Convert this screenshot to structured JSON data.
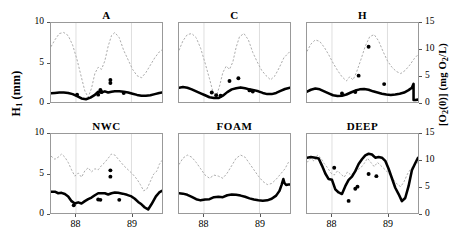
{
  "figure": {
    "y_axis_left": {
      "label": "H",
      "sub": "1",
      "units": "(mm)"
    },
    "y_axis_right": {
      "label_pre": "[O",
      "sub1": "2",
      "label_mid": "(0)] (mg O",
      "sub2": "2",
      "label_post": "/L)"
    }
  },
  "chart_data": {
    "type": "line",
    "title": "",
    "xlabel": "",
    "ylabel": "H1 (mm)",
    "y2label": "[O2(0)] (mg O2/L)",
    "xlim": [
      87.55,
      89.55
    ],
    "ylim": [
      0,
      10
    ],
    "y2lim": [
      0,
      15
    ],
    "xticks": [
      88,
      89
    ],
    "xtick_labels": [
      "88",
      "89"
    ],
    "yticks": [
      0,
      5,
      10
    ],
    "ytick_labels": [
      "0",
      "5",
      "10"
    ],
    "y2ticks": [
      0,
      5,
      10,
      15
    ],
    "y2tick_labels": [
      "0",
      "5",
      "10",
      "15"
    ],
    "grid": false,
    "legend": "none",
    "series_styles": {
      "h1_line": {
        "name": "H1",
        "style": "solid",
        "color": "#000000",
        "width": 2.6,
        "axis": "left"
      },
      "o2_line": {
        "name": "[O2(0)]",
        "style": "dashed",
        "color": "#aaaaaa",
        "width": 1.0,
        "axis": "right"
      },
      "o2_points": {
        "name": "[O2(0)] measured",
        "marker": "filled-circle",
        "color": "#000000",
        "size": 4.0,
        "axis": "right"
      }
    },
    "panels": [
      {
        "id": "A",
        "title": "A",
        "row": 0,
        "col": 0,
        "h1_line": {
          "x": [
            87.55,
            87.62,
            87.7,
            87.78,
            87.86,
            87.94,
            88.02,
            88.1,
            88.18,
            88.26,
            88.34,
            88.4,
            88.46,
            88.52,
            88.58,
            88.64,
            88.7,
            88.78,
            88.86,
            88.94,
            89.02,
            89.1,
            89.18,
            89.26,
            89.34,
            89.42,
            89.5,
            89.55
          ],
          "y": [
            1.1,
            1.15,
            1.2,
            1.2,
            1.15,
            1.0,
            0.75,
            0.45,
            0.35,
            0.55,
            0.9,
            1.3,
            1.2,
            1.35,
            1.2,
            1.3,
            1.35,
            1.35,
            1.3,
            1.2,
            1.05,
            0.9,
            0.8,
            0.8,
            0.85,
            1.0,
            1.15,
            1.2
          ]
        },
        "o2_line": {
          "x": [
            87.55,
            87.62,
            87.7,
            87.78,
            87.86,
            87.94,
            88.02,
            88.1,
            88.16,
            88.22,
            88.28,
            88.34,
            88.4,
            88.46,
            88.52,
            88.58,
            88.64,
            88.7,
            88.78,
            88.86,
            88.94,
            89.02,
            89.1,
            89.18,
            89.26,
            89.34,
            89.42,
            89.5,
            89.55
          ],
          "y": [
            10.5,
            11.8,
            13.0,
            13.2,
            12.6,
            10.8,
            8.0,
            4.6,
            2.1,
            0.9,
            2.6,
            5.4,
            6.6,
            6.2,
            7.8,
            10.6,
            12.6,
            13.2,
            12.2,
            9.8,
            8.0,
            6.2,
            5.0,
            4.6,
            5.6,
            7.0,
            8.4,
            9.5,
            9.9
          ]
        },
        "o2_points": [
          {
            "x": 88.02,
            "y": 1.4
          },
          {
            "x": 88.4,
            "y": 1.4
          },
          {
            "x": 88.44,
            "y": 2.3
          },
          {
            "x": 88.46,
            "y": 1.9
          },
          {
            "x": 88.62,
            "y": 4.2
          },
          {
            "x": 88.62,
            "y": 3.6
          },
          {
            "x": 88.86,
            "y": 1.7
          }
        ]
      },
      {
        "id": "C",
        "title": "C",
        "row": 0,
        "col": 1,
        "h1_line": {
          "x": [
            87.55,
            87.62,
            87.7,
            87.78,
            87.86,
            87.94,
            88.02,
            88.1,
            88.18,
            88.26,
            88.34,
            88.42,
            88.5,
            88.58,
            88.66,
            88.74,
            88.82,
            88.9,
            88.98,
            89.06,
            89.14,
            89.22,
            89.3,
            89.38,
            89.46,
            89.55
          ],
          "y": [
            1.8,
            1.9,
            1.8,
            1.6,
            1.35,
            1.1,
            0.85,
            0.6,
            0.5,
            0.5,
            0.8,
            1.25,
            1.6,
            1.75,
            1.85,
            1.75,
            1.6,
            1.5,
            1.35,
            1.15,
            1.0,
            1.0,
            1.15,
            1.4,
            1.65,
            1.8
          ]
        },
        "o2_line": {
          "x": [
            87.55,
            87.62,
            87.7,
            87.78,
            87.86,
            87.94,
            88.02,
            88.1,
            88.16,
            88.22,
            88.28,
            88.34,
            88.4,
            88.46,
            88.52,
            88.58,
            88.64,
            88.72,
            88.8,
            88.88,
            88.96,
            89.04,
            89.12,
            89.2,
            89.28,
            89.36,
            89.44,
            89.55
          ],
          "y": [
            9.8,
            11.6,
            12.8,
            13.0,
            12.2,
            10.2,
            7.4,
            4.4,
            2.0,
            1.0,
            3.0,
            5.6,
            6.8,
            6.2,
            7.6,
            10.4,
            12.4,
            13.0,
            11.8,
            9.4,
            7.6,
            6.0,
            5.0,
            4.2,
            5.0,
            6.6,
            8.4,
            9.6
          ]
        },
        "o2_points": [
          {
            "x": 88.14,
            "y": 1.8
          },
          {
            "x": 88.22,
            "y": 1.3
          },
          {
            "x": 88.3,
            "y": 1.2
          },
          {
            "x": 88.46,
            "y": 4.0
          },
          {
            "x": 88.62,
            "y": 4.5
          },
          {
            "x": 88.82,
            "y": 2.2
          },
          {
            "x": 88.88,
            "y": 2.0
          }
        ]
      },
      {
        "id": "H",
        "title": "H",
        "row": 0,
        "col": 2,
        "h1_line": {
          "x": [
            87.55,
            87.62,
            87.7,
            87.78,
            87.86,
            87.94,
            88.02,
            88.1,
            88.18,
            88.26,
            88.34,
            88.42,
            88.5,
            88.58,
            88.66,
            88.74,
            88.82,
            88.9,
            88.98,
            89.06,
            89.14,
            89.22,
            89.3,
            89.38,
            89.44,
            89.47,
            89.47,
            89.5,
            89.55
          ],
          "y": [
            1.3,
            1.55,
            1.7,
            1.6,
            1.35,
            1.1,
            0.85,
            0.75,
            0.8,
            0.95,
            1.2,
            1.45,
            1.6,
            1.65,
            1.55,
            1.35,
            1.2,
            1.05,
            0.95,
            0.9,
            0.95,
            1.05,
            1.2,
            1.5,
            1.8,
            2.3,
            0.25,
            0.25,
            0.3
          ]
        },
        "o2_line": {
          "x": [
            87.55,
            87.62,
            87.7,
            87.78,
            87.86,
            87.94,
            88.02,
            88.1,
            88.18,
            88.26,
            88.32,
            88.38,
            88.44,
            88.52,
            88.6,
            88.68,
            88.76,
            88.84,
            88.92,
            89.0,
            89.08,
            89.16,
            89.24,
            89.32,
            89.4,
            89.48,
            89.55
          ],
          "y": [
            9.6,
            11.0,
            11.8,
            11.5,
            10.4,
            9.0,
            7.4,
            6.0,
            4.8,
            4.0,
            4.8,
            4.2,
            5.6,
            8.0,
            10.6,
            12.4,
            12.8,
            11.6,
            9.6,
            7.8,
            6.6,
            5.8,
            5.4,
            6.0,
            7.0,
            8.2,
            9.0
          ]
        },
        "o2_points": [
          {
            "x": 88.18,
            "y": 1.6
          },
          {
            "x": 88.42,
            "y": 1.9
          },
          {
            "x": 88.48,
            "y": 5.0
          },
          {
            "x": 88.66,
            "y": 10.5
          },
          {
            "x": 88.94,
            "y": 3.4
          }
        ]
      },
      {
        "id": "NWC",
        "title": "NWC",
        "row": 1,
        "col": 0,
        "h1_line": {
          "x": [
            87.55,
            87.62,
            87.68,
            87.74,
            87.8,
            87.86,
            87.92,
            87.98,
            88.04,
            88.1,
            88.16,
            88.22,
            88.28,
            88.34,
            88.4,
            88.46,
            88.52,
            88.58,
            88.64,
            88.7,
            88.76,
            88.84,
            88.92,
            89.0,
            89.06,
            89.12,
            89.18,
            89.24,
            89.3,
            89.36,
            89.44,
            89.5,
            89.55
          ],
          "y": [
            2.7,
            2.7,
            2.5,
            2.55,
            2.4,
            2.1,
            1.5,
            1.2,
            1.35,
            1.2,
            1.5,
            1.75,
            1.95,
            2.25,
            2.5,
            2.5,
            2.5,
            2.35,
            2.5,
            2.6,
            2.55,
            2.45,
            2.3,
            2.1,
            1.8,
            1.4,
            1.1,
            0.7,
            0.45,
            1.1,
            2.1,
            2.6,
            2.8
          ]
        },
        "o2_line": {
          "x": [
            87.55,
            87.62,
            87.68,
            87.74,
            87.8,
            87.86,
            87.92,
            87.98,
            88.04,
            88.1,
            88.16,
            88.22,
            88.28,
            88.34,
            88.4,
            88.46,
            88.52,
            88.58,
            88.64,
            88.7,
            88.78,
            88.86,
            88.94,
            89.02,
            89.1,
            89.16,
            89.22,
            89.28,
            89.34,
            89.4,
            89.46,
            89.5,
            89.55
          ],
          "y": [
            10.8,
            10.2,
            10.6,
            11.2,
            10.6,
            9.6,
            8.2,
            7.0,
            7.6,
            6.8,
            8.0,
            8.6,
            7.8,
            8.4,
            8.2,
            9.0,
            9.6,
            10.4,
            11.2,
            11.0,
            10.0,
            9.0,
            8.2,
            7.4,
            6.4,
            5.4,
            4.2,
            4.6,
            6.0,
            7.4,
            8.0,
            9.2,
            10.0
          ]
        },
        "o2_points": [
          {
            "x": 87.96,
            "y": 1.45
          },
          {
            "x": 88.4,
            "y": 2.55
          },
          {
            "x": 88.44,
            "y": 2.5
          },
          {
            "x": 88.62,
            "y": 8.1
          },
          {
            "x": 88.62,
            "y": 6.9
          },
          {
            "x": 88.78,
            "y": 2.5
          }
        ]
      },
      {
        "id": "FOAM",
        "title": "FOAM",
        "row": 1,
        "col": 1,
        "h1_line": {
          "x": [
            87.55,
            87.62,
            87.7,
            87.78,
            87.86,
            87.94,
            88.02,
            88.1,
            88.18,
            88.26,
            88.34,
            88.42,
            88.5,
            88.58,
            88.66,
            88.74,
            88.82,
            88.9,
            88.98,
            89.06,
            89.14,
            89.22,
            89.3,
            89.36,
            89.4,
            89.43,
            89.45,
            89.48,
            89.52,
            89.55
          ],
          "y": [
            2.5,
            2.45,
            2.3,
            2.05,
            1.75,
            1.6,
            1.7,
            1.75,
            2.0,
            2.05,
            2.0,
            2.25,
            2.35,
            2.3,
            2.2,
            2.05,
            1.85,
            1.7,
            1.6,
            1.55,
            1.6,
            1.8,
            2.2,
            2.8,
            3.6,
            4.3,
            3.8,
            3.55,
            3.6,
            3.6
          ]
        },
        "o2_line": {
          "x": [
            87.55,
            87.62,
            87.7,
            87.78,
            87.86,
            87.94,
            88.02,
            88.1,
            88.18,
            88.26,
            88.34,
            88.42,
            88.5,
            88.58,
            88.66,
            88.74,
            88.82,
            88.9,
            88.98,
            89.06,
            89.14,
            89.22,
            89.3,
            89.38,
            89.46,
            89.52,
            89.55
          ],
          "y": [
            9.2,
            10.4,
            11.0,
            10.6,
            9.6,
            8.4,
            7.2,
            6.6,
            7.2,
            7.0,
            6.6,
            7.6,
            9.0,
            10.4,
            11.0,
            10.6,
            9.4,
            8.2,
            7.0,
            6.0,
            5.4,
            5.6,
            6.4,
            7.4,
            8.4,
            9.6,
            9.4
          ]
        },
        "o2_points": []
      },
      {
        "id": "DEEP",
        "title": "DEEP",
        "row": 1,
        "col": 2,
        "h1_line": {
          "x": [
            87.55,
            87.62,
            87.7,
            87.76,
            87.82,
            87.88,
            87.94,
            88.0,
            88.06,
            88.12,
            88.18,
            88.24,
            88.3,
            88.36,
            88.42,
            88.48,
            88.54,
            88.6,
            88.66,
            88.72,
            88.78,
            88.84,
            88.9,
            88.96,
            89.02,
            89.08,
            89.14,
            89.2,
            89.26,
            89.32,
            89.38,
            89.44,
            89.5,
            89.55
          ],
          "y": [
            7.0,
            7.1,
            7.0,
            6.9,
            6.0,
            5.0,
            4.3,
            4.2,
            3.0,
            2.6,
            2.4,
            3.4,
            4.2,
            4.6,
            5.3,
            6.2,
            6.8,
            7.3,
            7.5,
            7.4,
            7.0,
            7.1,
            7.0,
            6.6,
            5.6,
            4.4,
            3.2,
            2.4,
            1.5,
            1.9,
            3.4,
            5.4,
            6.3,
            7.0
          ]
        },
        "o2_line": {
          "x": [
            87.55,
            87.62,
            87.68,
            87.74,
            87.8,
            87.86,
            87.92,
            87.98,
            88.04,
            88.1,
            88.16,
            88.22,
            88.28,
            88.34,
            88.4,
            88.46,
            88.52,
            88.58,
            88.64,
            88.7,
            88.76,
            88.82,
            88.9,
            88.98,
            89.06,
            89.12,
            89.18,
            89.24,
            89.3,
            89.36,
            89.42,
            89.48,
            89.55
          ],
          "y": [
            9.6,
            10.4,
            9.8,
            11.0,
            10.4,
            9.4,
            8.6,
            7.6,
            7.2,
            8.0,
            7.4,
            6.8,
            7.8,
            7.2,
            7.8,
            8.2,
            8.6,
            9.4,
            10.4,
            9.6,
            8.8,
            9.6,
            8.8,
            8.0,
            7.0,
            6.2,
            5.4,
            5.0,
            6.0,
            7.4,
            8.4,
            9.0,
            9.6
          ]
        },
        "o2_points": [
          {
            "x": 88.04,
            "y": 8.6
          },
          {
            "x": 88.3,
            "y": 2.3
          },
          {
            "x": 88.42,
            "y": 4.6
          },
          {
            "x": 88.46,
            "y": 5.0
          },
          {
            "x": 88.66,
            "y": 7.4
          },
          {
            "x": 88.8,
            "y": 7.0
          }
        ]
      }
    ]
  }
}
